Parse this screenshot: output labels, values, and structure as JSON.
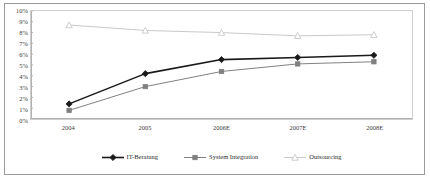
{
  "chart_data": {
    "type": "line",
    "title": "",
    "xlabel": "",
    "ylabel": "",
    "categories": [
      "2004",
      "2005",
      "2006E",
      "2007E",
      "2008E"
    ],
    "ylim": [
      0,
      10
    ],
    "y_tick_labels": [
      "10%",
      "9%",
      "8%",
      "7%",
      "6%",
      "5%",
      "4%",
      "3%",
      "2%",
      "1%",
      "0%"
    ],
    "y_tick_values": [
      10,
      9,
      8,
      7,
      6,
      5,
      4,
      3,
      2,
      1,
      0
    ],
    "y_tick_step": 1,
    "y_unit": "%",
    "grid": false,
    "legend_position": "bottom",
    "series": [
      {
        "name": "IT-Beratung",
        "values": [
          1.4,
          4.2,
          5.5,
          5.7,
          5.9
        ],
        "color": "#1a1a1a",
        "marker": "diamond",
        "line_width": 1.6
      },
      {
        "name": "System Integration",
        "values": [
          0.8,
          3.0,
          4.4,
          5.1,
          5.3
        ],
        "color": "#7f7f7f",
        "marker": "square",
        "line_width": 1.0
      },
      {
        "name": "Outsourcing",
        "values": [
          8.7,
          8.2,
          8.0,
          7.7,
          7.8
        ],
        "color": "#c8c8c8",
        "marker": "triangle",
        "line_width": 1.0
      }
    ]
  },
  "legend": {
    "items": [
      {
        "label": "IT-Beratung",
        "marker": "diamond-marker",
        "color": "#1a1a1a"
      },
      {
        "label": "System Integration",
        "marker": "square-marker",
        "color": "#7f7f7f"
      },
      {
        "label": "Outsourcing",
        "marker": "triangle-marker",
        "color": "#c8c8c8"
      }
    ]
  },
  "axis": {
    "axis_line_color": "#b0b0b0",
    "plot_border_color": "#cfcfcf",
    "frame_color": "#9a9a9a"
  }
}
